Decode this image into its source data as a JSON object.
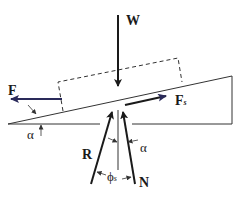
{
  "diagram": {
    "type": "free-body diagram of block on inclined plane",
    "labels": {
      "weight": "W",
      "applied_force": "F",
      "friction_force": "F",
      "friction_sub": "s",
      "resultant": "R",
      "normal": "N",
      "incline_angle": "α",
      "normal_angle": "α",
      "friction_angle": "ϕ",
      "friction_angle_sub": "s"
    },
    "colors": {
      "line": "#333333",
      "arrow_dark": "#1a1a1a",
      "arrow_blue": "#2a2a5a",
      "background": "#ffffff"
    }
  }
}
